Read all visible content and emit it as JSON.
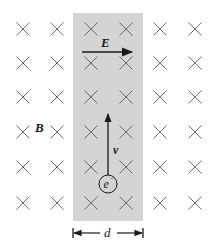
{
  "diagram": {
    "labels": {
      "magnetic_field": "B",
      "electric_field": "E",
      "velocity": "v",
      "electron": "e",
      "electron_charge": "−",
      "width": "d"
    },
    "field_direction": "into-page",
    "grid": {
      "columns_x": [
        23,
        57,
        91,
        126,
        160,
        195
      ],
      "rows_y": [
        29,
        63,
        97,
        132,
        167,
        203
      ]
    },
    "colors": {
      "region_fill": "#d4d4d4",
      "cross_stroke": "#6a6a6a",
      "arrow": "#1a1a1a",
      "background": "#ffffff"
    }
  }
}
